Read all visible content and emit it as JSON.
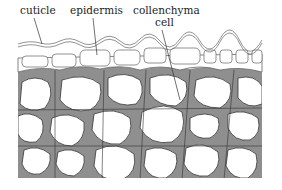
{
  "diagram": {
    "labels": {
      "cuticle": "cuticle",
      "epidermis": "epidermis",
      "collenchyma_line1": "collenchyma",
      "collenchyma_line2": "cell"
    },
    "colors": {
      "wall_thickening": "#8f8f8f",
      "outline": "#333333",
      "cell_lumen": "#ffffff",
      "epidermis_outline": "#777777"
    }
  }
}
